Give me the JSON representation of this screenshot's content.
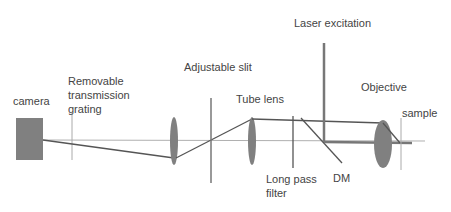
{
  "diagram": {
    "labels": {
      "camera": "camera",
      "grating_line1": "Removable",
      "grating_line2": "transmission",
      "grating_line3": "grating",
      "slit": "Adjustable slit",
      "tube_lens": "Tube lens",
      "laser": "Laser excitation",
      "objective": "Objective",
      "sample": "sample",
      "filter_line1": "Long pass",
      "filter_line2": "filter",
      "dm": "DM"
    },
    "components": [
      {
        "name": "camera",
        "type": "detector"
      },
      {
        "name": "Removable transmission grating",
        "type": "grating"
      },
      {
        "name": "Lens",
        "type": "lens"
      },
      {
        "name": "Adjustable slit",
        "type": "aperture"
      },
      {
        "name": "Tube lens",
        "type": "lens"
      },
      {
        "name": "Long pass filter",
        "type": "filter"
      },
      {
        "name": "DM",
        "type": "dichroic mirror"
      },
      {
        "name": "Laser excitation",
        "type": "source"
      },
      {
        "name": "Objective",
        "type": "lens"
      },
      {
        "name": "sample",
        "type": "specimen"
      }
    ],
    "colors": {
      "component_fill": "#808080",
      "beam": "#555555",
      "axis": "#aaaaaa",
      "text": "#444444"
    }
  }
}
